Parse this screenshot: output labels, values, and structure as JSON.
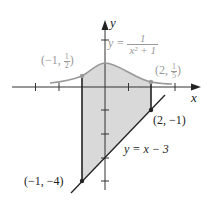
{
  "diagram": {
    "type": "region-between-curves",
    "axes": {
      "x_label": "x",
      "y_label": "y",
      "origin_px": [
        105,
        87
      ],
      "unit_px": 23.3
    },
    "curves": [
      {
        "name": "upper",
        "equation": "y = 1/(x^2 + 1)",
        "label_lhs": "y =",
        "label_num": "1",
        "label_den": "x² + 1",
        "color": "#999999"
      },
      {
        "name": "lower",
        "equation": "y = x - 3",
        "label": "y = x − 3",
        "color": "#222222"
      }
    ],
    "region": {
      "x_from": -1,
      "x_to": 2,
      "fill": "#d9d9d9"
    },
    "points": [
      {
        "label_prefix": "(−1, ",
        "frac_num": "1",
        "frac_den": "2",
        "label_suffix": ")",
        "x": -1,
        "y": 0.5
      },
      {
        "label_prefix": "(2, ",
        "frac_num": "1",
        "frac_den": "5",
        "label_suffix": ")",
        "x": 2,
        "y": 0.2
      },
      {
        "label": "(2, −1)",
        "x": 2,
        "y": -1
      },
      {
        "label": "(−1, −4)",
        "x": -1,
        "y": -4
      }
    ]
  }
}
